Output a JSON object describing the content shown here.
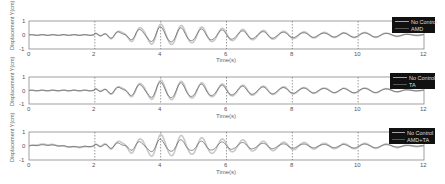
{
  "chart_data": [
    {
      "type": "line",
      "title": "",
      "xlabel": "Time(s)",
      "ylabel": "Displacement Y(cm)",
      "xlim": [
        0,
        12
      ],
      "ylim": [
        -1,
        1
      ],
      "xticks": [
        0,
        2,
        4,
        6,
        8,
        10,
        12
      ],
      "yticks": [
        -1,
        0,
        1
      ],
      "grid": "vertical dashed",
      "legend_position": "top-right",
      "series": [
        {
          "name": "No Control",
          "color": "#c8c8c8",
          "amplitude_peak": 0.75,
          "description": "decaying oscillation starting near t=2s, peak near t=4s, period ~0.6s"
        },
        {
          "name": "AMD",
          "color": "#555555",
          "amplitude_peak": 0.55,
          "description": "controlled response slightly smaller than No Control"
        }
      ]
    },
    {
      "type": "line",
      "title": "",
      "xlabel": "Time(s)",
      "ylabel": "Displacement Y(cm)",
      "xlim": [
        0,
        12
      ],
      "ylim": [
        -1,
        1
      ],
      "xticks": [
        0,
        2,
        4,
        6,
        8,
        10,
        12
      ],
      "yticks": [
        -1,
        0,
        1
      ],
      "grid": "vertical dashed",
      "legend_position": "top-right",
      "series": [
        {
          "name": "No Control",
          "color": "#c8c8c8",
          "amplitude_peak": 0.75
        },
        {
          "name": "TA",
          "color": "#555555",
          "amplitude_peak": 0.6
        }
      ]
    },
    {
      "type": "line",
      "title": "",
      "xlabel": "Time(s)",
      "ylabel": "Displacement Y(cm)",
      "xlim": [
        0,
        12
      ],
      "ylim": [
        -1,
        1
      ],
      "xticks": [
        0,
        2,
        4,
        6,
        8,
        10,
        12
      ],
      "yticks": [
        -1,
        0,
        1
      ],
      "grid": "vertical dashed",
      "legend_position": "top-right",
      "series": [
        {
          "name": "No Control",
          "color": "#c8c8c8",
          "amplitude_peak": 0.8
        },
        {
          "name": "AMD+TA",
          "color": "#555555",
          "amplitude_peak": 0.45,
          "description": "includes low-frequency drift in first 2s"
        }
      ]
    }
  ],
  "plots": [
    {
      "ylabel": "Displacement Y(cm)",
      "xlabel": "Time(s)",
      "legend": [
        "No Control",
        "AMD"
      ],
      "ytick_labels": [
        "1",
        "0",
        "-1"
      ],
      "xtick_labels": [
        "0",
        "2",
        "4",
        "6",
        "8",
        "10",
        "12"
      ]
    },
    {
      "ylabel": "Displacement Y(cm)",
      "xlabel": "Time(s)",
      "legend": [
        "No Control",
        "TA"
      ],
      "ytick_labels": [
        "1",
        "0",
        "-1"
      ],
      "xtick_labels": [
        "0",
        "2",
        "4",
        "6",
        "8",
        "10",
        "12"
      ]
    },
    {
      "ylabel": "Displacement Y(cm)",
      "xlabel": "Time(s)",
      "legend": [
        "No Control",
        "AMD+TA"
      ],
      "ytick_labels": [
        "1",
        "0",
        "-1"
      ],
      "xtick_labels": [
        "0",
        "2",
        "4",
        "6",
        "8",
        "10",
        "12"
      ]
    }
  ]
}
